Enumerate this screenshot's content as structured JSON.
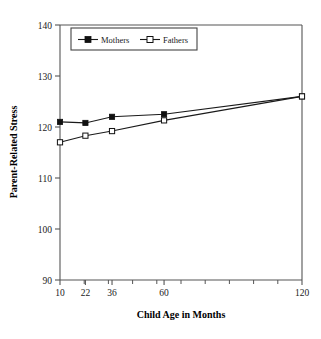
{
  "chart_data": {
    "type": "line",
    "title": "",
    "xlabel": "Child Age in Months",
    "ylabel": "Parent-Related Stress",
    "categories": [
      "10",
      "22",
      "36",
      "60",
      "120"
    ],
    "xtick_labels": [
      "10",
      "22",
      "36",
      "60",
      "120"
    ],
    "ytick_labels": [
      "90",
      "100",
      "110",
      "120",
      "130",
      "140"
    ],
    "ylim": [
      90,
      140
    ],
    "ytick_step": 10,
    "grid": false,
    "legend_position": "top-center",
    "axis_type": "ordinal",
    "series": [
      {
        "name": "Mothers",
        "marker": "filled-square",
        "color": "#111111",
        "values": [
          121.0,
          120.8,
          122.0,
          122.5,
          126.0
        ]
      },
      {
        "name": "Fathers",
        "marker": "open-square",
        "color": "#111111",
        "values": [
          117.0,
          118.3,
          119.2,
          121.3,
          126.0
        ]
      }
    ]
  },
  "legend": {
    "entries": [
      {
        "label": "Mothers"
      },
      {
        "label": "Fathers"
      }
    ]
  }
}
